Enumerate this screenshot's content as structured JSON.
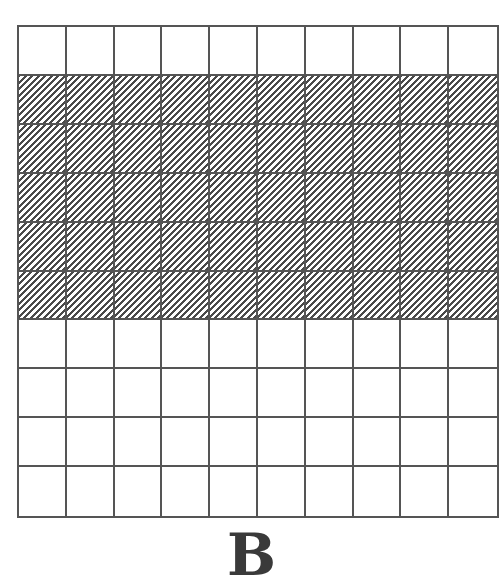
{
  "figure": {
    "label": "B",
    "grid": {
      "rows": 10,
      "columns": 10,
      "shaded_rows": [
        2,
        3,
        4,
        5,
        6
      ],
      "shaded_cell_count": 50,
      "total_cells": 100,
      "shading_pattern": "diagonal-hatch",
      "line_color": "#555555",
      "hatch_color": "#4a4a4a",
      "background_color": "#ffffff"
    }
  }
}
